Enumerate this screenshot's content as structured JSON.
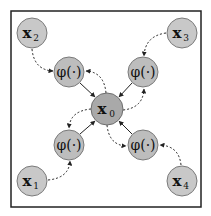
{
  "diagram": {
    "frame": {
      "x": 11,
      "y": 11,
      "width": 190,
      "height": 196,
      "stroke": "#222222"
    },
    "colors": {
      "outer_node_fill": "#c8c8c8",
      "phi_node_fill": "#bdbdbd",
      "center_node_fill": "#a9a9a9",
      "node_stroke": "#7a7a7a",
      "edge": "#222222"
    },
    "nodes": {
      "x0": {
        "label": "x",
        "sub": "0",
        "cx": 107,
        "cy": 109,
        "r": 16
      },
      "x1": {
        "label": "x",
        "sub": "1",
        "cx": 32,
        "cy": 181,
        "r": 15
      },
      "x2": {
        "label": "x",
        "sub": "2",
        "cx": 32,
        "cy": 33,
        "r": 15
      },
      "x3": {
        "label": "x",
        "sub": "3",
        "cx": 182,
        "cy": 33,
        "r": 15
      },
      "x4": {
        "label": "x",
        "sub": "4",
        "cx": 182,
        "cy": 181,
        "r": 15
      },
      "phi_tl": {
        "label": "φ(·)",
        "cx": 69,
        "cy": 72,
        "r": 15
      },
      "phi_tr": {
        "label": "φ(·)",
        "cx": 143,
        "cy": 72,
        "r": 15
      },
      "phi_bl": {
        "label": "φ(·)",
        "cx": 69,
        "cy": 145,
        "r": 15
      },
      "phi_br": {
        "label": "φ(·)",
        "cx": 143,
        "cy": 145,
        "r": 15
      }
    },
    "edges": [
      {
        "from": "x2",
        "to": "phi_tl",
        "style": "dashed"
      },
      {
        "from": "x3",
        "to": "phi_tr",
        "style": "dashed"
      },
      {
        "from": "x1",
        "to": "phi_bl",
        "style": "dashed"
      },
      {
        "from": "x4",
        "to": "phi_br",
        "style": "dashed"
      },
      {
        "from": "phi_tl",
        "to": "x0",
        "style": "solid"
      },
      {
        "from": "phi_tr",
        "to": "x0",
        "style": "solid"
      },
      {
        "from": "phi_bl",
        "to": "x0",
        "style": "solid"
      },
      {
        "from": "phi_br",
        "to": "x0",
        "style": "solid"
      },
      {
        "from": "x0",
        "to": "phi_tl",
        "style": "dashed"
      },
      {
        "from": "x0",
        "to": "phi_tr",
        "style": "dashed"
      },
      {
        "from": "x0",
        "to": "phi_bl",
        "style": "dashed"
      },
      {
        "from": "x0",
        "to": "phi_br",
        "style": "dashed"
      }
    ]
  }
}
